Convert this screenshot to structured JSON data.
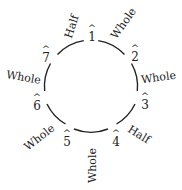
{
  "diagram": {
    "type": "scale-degree-circle",
    "degrees": [
      {
        "number": "1",
        "mark": "^"
      },
      {
        "number": "2",
        "mark": "^"
      },
      {
        "number": "3",
        "mark": "^"
      },
      {
        "number": "4",
        "mark": "^"
      },
      {
        "number": "5",
        "mark": "^"
      },
      {
        "number": "6",
        "mark": "^"
      },
      {
        "number": "7",
        "mark": "^"
      }
    ],
    "steps": [
      {
        "between": "1-2",
        "label": "Whole"
      },
      {
        "between": "2-3",
        "label": "Whole"
      },
      {
        "between": "3-4",
        "label": "Half"
      },
      {
        "between": "4-5",
        "label": "Whole"
      },
      {
        "between": "5-6",
        "label": "Whole"
      },
      {
        "between": "6-7",
        "label": "Whole"
      },
      {
        "between": "7-1",
        "label": "Half"
      }
    ],
    "colors": {
      "stroke": "#222222",
      "background": "#ffffff"
    }
  }
}
